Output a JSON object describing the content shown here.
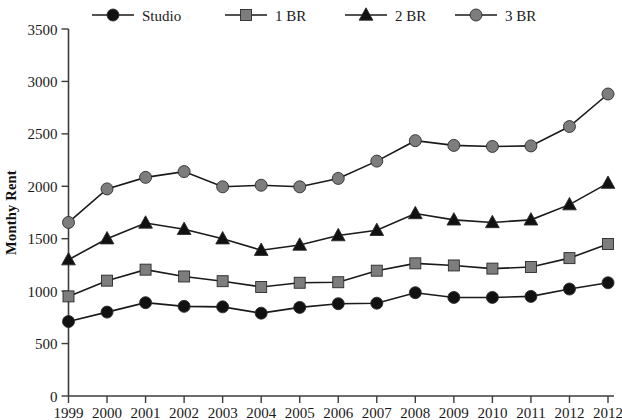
{
  "chart_data": {
    "type": "line",
    "title": "",
    "xlabel": "",
    "ylabel": "Monthy Rent",
    "ylim": [
      0,
      3500
    ],
    "yticks": [
      0,
      500,
      1000,
      1500,
      2000,
      2500,
      3000,
      3500
    ],
    "ytick_labels": [
      "0",
      "500",
      "1000",
      "1500",
      "2000",
      "2500",
      "3000",
      "3500"
    ],
    "grid": false,
    "legend_position": "top",
    "categories": [
      "1999",
      "2000",
      "2001",
      "2002",
      "2003",
      "2004",
      "2005",
      "2006",
      "2007",
      "2008",
      "2009",
      "2010",
      "2011",
      "2012",
      "2012"
    ],
    "series": [
      {
        "name": "Studio",
        "marker": "circle",
        "color": "#111111",
        "line_color": "#1a1a1a",
        "values": [
          710,
          800,
          890,
          855,
          850,
          790,
          845,
          880,
          885,
          985,
          940,
          940,
          950,
          1020,
          1080
        ]
      },
      {
        "name": "1 BR",
        "marker": "square",
        "color": "#7d7d7d",
        "line_color": "#1a1a1a",
        "values": [
          950,
          1100,
          1205,
          1140,
          1095,
          1040,
          1080,
          1085,
          1195,
          1265,
          1245,
          1215,
          1230,
          1315,
          1450
        ]
      },
      {
        "name": "2 BR",
        "marker": "triangle",
        "color": "#111111",
        "line_color": "#1a1a1a",
        "values": [
          1300,
          1500,
          1650,
          1590,
          1500,
          1390,
          1440,
          1530,
          1580,
          1740,
          1680,
          1655,
          1680,
          1825,
          2030
        ]
      },
      {
        "name": "3 BR",
        "marker": "circle",
        "color": "#7d7d7d",
        "line_color": "#1a1a1a",
        "values": [
          1655,
          1975,
          2085,
          2140,
          1995,
          2010,
          1995,
          2075,
          2240,
          2435,
          2390,
          2380,
          2385,
          2570,
          2880
        ]
      }
    ]
  },
  "legend": {
    "items": [
      {
        "label": "Studio"
      },
      {
        "label": "1 BR"
      },
      {
        "label": "2 BR"
      },
      {
        "label": "3 BR"
      }
    ]
  }
}
